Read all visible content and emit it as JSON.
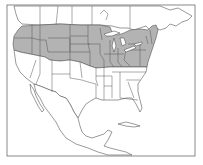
{
  "map": {
    "type": "range-map",
    "region": "North America",
    "colors": {
      "background": "#ffffff",
      "land": "#ffffff",
      "range_fill": "#b3b3b3",
      "outline": "#555555",
      "frame": "#6b6b6b"
    },
    "shaded_range": "Northern United States (Pacific Northwest to New England), south to roughly 37°N"
  }
}
